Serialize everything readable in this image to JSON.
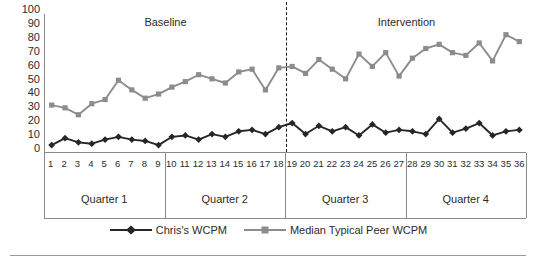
{
  "chart_data": {
    "type": "line",
    "title": "",
    "xlabel": "",
    "ylabel": "",
    "ylim": [
      0,
      100
    ],
    "ytick_step": 10,
    "yticks": [
      100,
      90,
      80,
      70,
      60,
      50,
      40,
      30,
      20,
      10,
      0
    ],
    "grid": false,
    "legend_position": "bottom-center",
    "x": [
      1,
      2,
      3,
      4,
      5,
      6,
      7,
      8,
      9,
      10,
      11,
      12,
      13,
      14,
      15,
      16,
      17,
      18,
      19,
      20,
      21,
      22,
      23,
      24,
      25,
      26,
      27,
      28,
      29,
      30,
      31,
      32,
      33,
      34,
      35,
      36
    ],
    "xtick_labels": [
      "1",
      "2",
      "3",
      "4",
      "5",
      "6",
      "7",
      "8",
      "9",
      "10",
      "11",
      "12",
      "13",
      "14",
      "15",
      "16",
      "17",
      "18",
      "19",
      "20",
      "21",
      "22",
      "23",
      "24",
      "25",
      "26",
      "27",
      "28",
      "29",
      "30",
      "31",
      "32",
      "33",
      "34",
      "35",
      "36"
    ],
    "series": [
      {
        "name": "Chris's WCPM",
        "color": "#262626",
        "marker": "diamond",
        "values": [
          5,
          10,
          7,
          6,
          9,
          11,
          9,
          8,
          5,
          11,
          12,
          9,
          13,
          11,
          15,
          16,
          13,
          18,
          21,
          13,
          19,
          15,
          18,
          12,
          20,
          14,
          16,
          15,
          13,
          24,
          14,
          17,
          21,
          12,
          15,
          16
        ]
      },
      {
        "name": "Median Typical Peer WCPM",
        "color": "#8c8c8c",
        "marker": "square",
        "values": [
          34,
          32,
          27,
          35,
          38,
          52,
          45,
          39,
          42,
          47,
          51,
          56,
          53,
          50,
          58,
          60,
          45,
          61,
          62,
          57,
          67,
          60,
          53,
          71,
          62,
          72,
          55,
          68,
          75,
          78,
          72,
          70,
          79,
          66,
          85,
          80
        ]
      }
    ],
    "phases": [
      {
        "label": "Baseline",
        "start": 1,
        "end": 18
      },
      {
        "label": "Intervention",
        "start": 19,
        "end": 36
      }
    ],
    "phase_change_after": 18,
    "quarters": [
      {
        "label": "Quarter 1",
        "start": 1,
        "end": 9
      },
      {
        "label": "Quarter 2",
        "start": 10,
        "end": 18
      },
      {
        "label": "Quarter 3",
        "start": 19,
        "end": 27
      },
      {
        "label": "Quarter 4",
        "start": 28,
        "end": 36
      }
    ]
  }
}
